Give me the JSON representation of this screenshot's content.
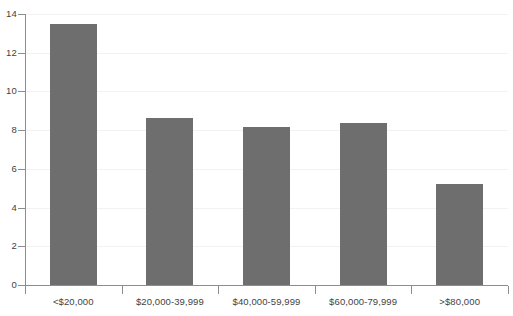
{
  "chart_data": {
    "type": "bar",
    "title": "",
    "subtitle": "",
    "xlabel": "",
    "ylabel": "",
    "categories": [
      "<$20,000",
      "$20,000-39,999",
      "$40,000-59,999",
      "$60,000-79,999",
      ">$80,000"
    ],
    "values": [
      13.5,
      8.65,
      8.15,
      8.35,
      5.2
    ],
    "ylim": [
      0,
      14
    ],
    "ytick_labels": [
      "0",
      "2",
      "4",
      "6",
      "8",
      "10",
      "12",
      "14"
    ],
    "ytick_values": [
      0,
      2,
      4,
      6,
      8,
      10,
      12,
      14
    ],
    "grid": true,
    "legend": false,
    "legend_position": "none",
    "series": [
      {
        "name": "",
        "values": [
          13.5,
          8.65,
          8.15,
          8.35,
          5.2
        ]
      }
    ]
  },
  "colors": {
    "bar_fill": "#6e6e6e",
    "gridline": "#f2f2f2",
    "axis_line": "#8d8d8d",
    "tick_label": "#3f3f3f",
    "background": "#ffffff"
  }
}
